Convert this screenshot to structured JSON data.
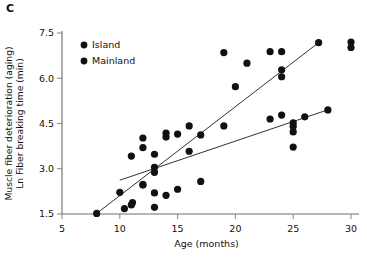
{
  "panel": {
    "label": "C"
  },
  "chart_data": {
    "type": "scatter",
    "title": "",
    "xlabel": "Age (months)",
    "ylabel": "Muscle fiber deterioration (aging)\nLn Fiber breaking time (min)",
    "ylabel_line1": "Muscle fiber deterioration (aging)",
    "ylabel_line2": "Ln Fiber breaking time (min)",
    "xlim": [
      5,
      30
    ],
    "ylim": [
      1.5,
      7.5
    ],
    "xticks": [
      5,
      10,
      15,
      20,
      25,
      30
    ],
    "xtick_labels": [
      "5",
      "10",
      "15",
      "20",
      "25",
      "30"
    ],
    "yticks": [
      1.5,
      3.0,
      4.5,
      6.0,
      7.5
    ],
    "ytick_labels": [
      "1.5",
      "3.0",
      "4.5",
      "6.0",
      "7.5"
    ],
    "grid": false,
    "legend_position": "top-left",
    "marker_color": "#111111",
    "line_color": "#1a1a1a",
    "series": [
      {
        "name": "Island",
        "marker": "filled-circle",
        "color": "#111111",
        "points": [
          [
            8.0,
            1.52
          ],
          [
            10.0,
            2.22
          ],
          [
            11.0,
            3.42
          ],
          [
            12.0,
            3.7
          ],
          [
            12.0,
            4.02
          ],
          [
            12.0,
            2.48
          ],
          [
            13.0,
            3.05
          ],
          [
            13.0,
            2.88
          ],
          [
            13.0,
            3.48
          ],
          [
            14.0,
            4.05
          ],
          [
            14.0,
            4.18
          ],
          [
            15.0,
            4.15
          ],
          [
            16.0,
            4.42
          ],
          [
            16.0,
            3.58
          ],
          [
            17.0,
            4.12
          ],
          [
            19.0,
            6.85
          ],
          [
            20.0,
            5.72
          ],
          [
            21.0,
            6.5
          ],
          [
            23.0,
            6.88
          ],
          [
            24.0,
            6.28
          ],
          [
            24.0,
            6.05
          ],
          [
            24.0,
            6.88
          ],
          [
            27.2,
            7.18
          ],
          [
            30.0,
            7.2
          ],
          [
            30.0,
            7.02
          ]
        ],
        "fit_line": {
          "x1": 8.0,
          "y1": 1.52,
          "x2": 27.2,
          "y2": 7.18
        }
      },
      {
        "name": "Mainland",
        "marker": "filled-circle",
        "color": "#111111",
        "points": [
          [
            10.4,
            1.68
          ],
          [
            11.0,
            1.8
          ],
          [
            11.1,
            1.88
          ],
          [
            12.0,
            2.46
          ],
          [
            13.0,
            2.2
          ],
          [
            13.0,
            1.72
          ],
          [
            14.0,
            2.12
          ],
          [
            15.0,
            2.32
          ],
          [
            17.0,
            2.58
          ],
          [
            19.0,
            4.42
          ],
          [
            23.0,
            4.65
          ],
          [
            24.0,
            4.78
          ],
          [
            25.0,
            4.52
          ],
          [
            25.0,
            4.4
          ],
          [
            25.0,
            4.22
          ],
          [
            25.0,
            3.72
          ],
          [
            26.0,
            4.72
          ],
          [
            28.0,
            4.95
          ]
        ],
        "fit_line": {
          "x1": 10.0,
          "y1": 2.62,
          "x2": 28.2,
          "y2": 4.98
        }
      }
    ],
    "legend": [
      {
        "label": "Island",
        "marker": "filled-circle",
        "color": "#111111"
      },
      {
        "label": "Mainland",
        "marker": "filled-circle",
        "color": "#111111"
      }
    ]
  }
}
